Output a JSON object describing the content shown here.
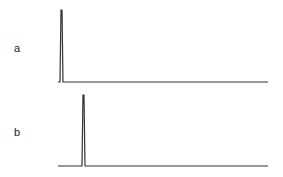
{
  "chart_data": [
    {
      "type": "line",
      "panel": "a",
      "title": "",
      "xlabel": "",
      "ylabel": "",
      "grid": false,
      "description": "Single sharp peak near the left end of the baseline",
      "peak": {
        "x_fraction": 0.02,
        "height_fraction": 1.0
      },
      "baseline": {
        "x_start": 58,
        "x_end": 268,
        "y": 82
      },
      "peak_px": {
        "x": 62,
        "y_top": 10,
        "y_base": 82
      }
    },
    {
      "type": "line",
      "panel": "b",
      "title": "",
      "xlabel": "",
      "ylabel": "",
      "grid": false,
      "description": "Single sharp peak slightly further right than panel a",
      "peak": {
        "x_fraction": 0.12,
        "height_fraction": 1.0
      },
      "baseline": {
        "x_start": 58,
        "x_end": 268,
        "y": 166
      },
      "peak_px": {
        "x": 84,
        "y_top": 95,
        "y_base": 166
      }
    }
  ],
  "labels": {
    "a": "a",
    "b": "b"
  },
  "colors": {
    "trace": "#333333",
    "text": "#222222"
  }
}
